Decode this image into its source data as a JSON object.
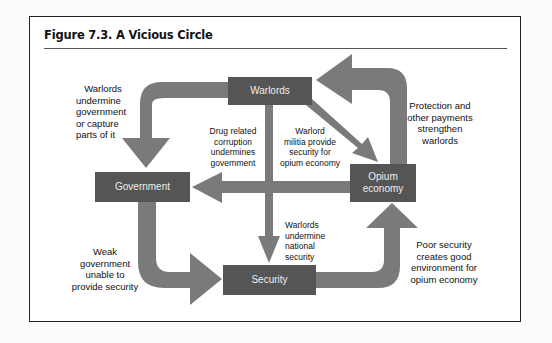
{
  "figure": {
    "title": "Figure 7.3.  A Vicious Circle"
  },
  "nodes": {
    "warlords": "Warlords",
    "government": "Government",
    "opium_economy": "Opium economy",
    "security": "Security"
  },
  "edges": [
    {
      "from": "Warlords",
      "to": "Government",
      "label": "Warlords undermine government or capture parts of it"
    },
    {
      "from": "Warlords",
      "to": "Opium economy",
      "label": "Warlord militia provide security for opium economy"
    },
    {
      "from": "Warlords",
      "to": "Security",
      "label": "Warlords undermine national security"
    },
    {
      "from": "Opium economy",
      "to": "Warlords",
      "label": "Protection and other payments strengthen warlords"
    },
    {
      "from": "Opium economy",
      "to": "Government",
      "label": "Drug related corruption undermines government"
    },
    {
      "from": "Government",
      "to": "Security",
      "label": "Weak government unable to provide security"
    },
    {
      "from": "Security",
      "to": "Opium economy",
      "label": "Poor security creates good environment for opium economy"
    }
  ],
  "labels": {
    "warlords_to_gov": [
      "Warlords",
      "undermine",
      "government",
      "or capture",
      "parts of it"
    ],
    "drug_corruption": [
      "Drug related",
      "corruption",
      "undermines",
      "government"
    ],
    "militia": [
      "Warlord",
      "militia provide",
      "security for",
      "opium economy"
    ],
    "protection": [
      "Protection and",
      "other payments",
      "strengthen",
      "warlords"
    ],
    "national_security": [
      "Warlords",
      "undermine",
      "national",
      "security"
    ],
    "weak_gov": [
      "Weak",
      "government",
      "unable to",
      "provide security"
    ],
    "poor_security": [
      "Poor security",
      "creates good",
      "environment for",
      "opium economy"
    ]
  },
  "colors": {
    "node_fill": "#555555",
    "arrow_fill": "#7a7a7a",
    "frame": "#222222"
  }
}
